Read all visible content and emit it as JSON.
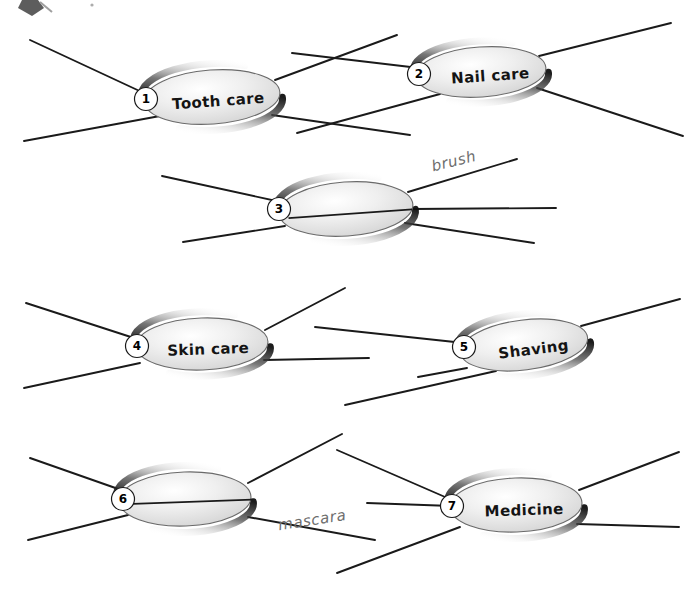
{
  "page": {
    "width": 687,
    "height": 591,
    "background": "#ffffff",
    "corner_mark": "partial-arrow-mark"
  },
  "colors": {
    "line": "#1a1a1a",
    "ellipse_fill_light": "#f3f3f3",
    "ellipse_fill_mid": "#d8d8d8",
    "ellipse_shadow": "#1c1c1c",
    "ellipse_stroke": "#6a6a6a",
    "text": "#141414",
    "handwriting": "#6d6d6d",
    "number_circle_fill": "#ffffff",
    "number_circle_stroke": "#1a1a1a"
  },
  "nodes": [
    {
      "number": "1",
      "label": "Tooth care",
      "blank": false,
      "cx": 212,
      "cy": 97,
      "rx": 68,
      "ry": 27,
      "rot": -4,
      "num_cx": 146,
      "num_cy": 99,
      "label_x": 218,
      "label_y": 102,
      "spokes": [
        {
          "x1": 146,
          "y1": 94,
          "x2": 30,
          "y2": 40
        },
        {
          "x1": 275,
          "y1": 80,
          "x2": 397,
          "y2": 35
        },
        {
          "x1": 160,
          "y1": 116,
          "x2": 24,
          "y2": 141
        },
        {
          "x1": 272,
          "y1": 115,
          "x2": 410,
          "y2": 135
        }
      ]
    },
    {
      "number": "2",
      "label": "Nail care",
      "blank": false,
      "cx": 481,
      "cy": 72,
      "rx": 65,
      "ry": 25,
      "rot": -4,
      "num_cx": 419,
      "num_cy": 74,
      "label_x": 490,
      "label_y": 77,
      "spokes": [
        {
          "x1": 419,
          "y1": 68,
          "x2": 292,
          "y2": 53
        },
        {
          "x1": 539,
          "y1": 56,
          "x2": 671,
          "y2": 23
        },
        {
          "x1": 440,
          "y1": 94,
          "x2": 297,
          "y2": 133
        },
        {
          "x1": 537,
          "y1": 88,
          "x2": 683,
          "y2": 136
        }
      ]
    },
    {
      "number": "3",
      "label": "",
      "blank": true,
      "cx": 346,
      "cy": 209,
      "rx": 67,
      "ry": 27,
      "rot": -4,
      "num_cx": 279,
      "num_cy": 209,
      "label_x": 346,
      "label_y": 214,
      "writing_line": {
        "x1": 288,
        "y1": 214,
        "x2": 412,
        "y2": 214
      },
      "spokes": [
        {
          "x1": 281,
          "y1": 202,
          "x2": 162,
          "y2": 176
        },
        {
          "x1": 408,
          "y1": 192,
          "x2": 517,
          "y2": 159
        },
        {
          "x1": 285,
          "y1": 226,
          "x2": 183,
          "y2": 242
        },
        {
          "x1": 405,
          "y1": 223,
          "x2": 534,
          "y2": 243
        },
        {
          "x1": 412,
          "y1": 209,
          "x2": 556,
          "y2": 208
        }
      ]
    },
    {
      "number": "4",
      "label": "Skin care",
      "blank": false,
      "cx": 202,
      "cy": 344,
      "rx": 66,
      "ry": 26,
      "rot": -2,
      "num_cx": 137,
      "num_cy": 346,
      "label_x": 208,
      "label_y": 350,
      "spokes": [
        {
          "x1": 137,
          "y1": 339,
          "x2": 26,
          "y2": 303
        },
        {
          "x1": 265,
          "y1": 330,
          "x2": 345,
          "y2": 288
        },
        {
          "x1": 140,
          "y1": 363,
          "x2": 24,
          "y2": 388
        },
        {
          "x1": 264,
          "y1": 360,
          "x2": 369,
          "y2": 358
        }
      ]
    },
    {
      "number": "5",
      "label": "Shaving",
      "blank": false,
      "cx": 524,
      "cy": 345,
      "rx": 64,
      "ry": 25,
      "rot": -7,
      "num_cx": 464,
      "num_cy": 347,
      "label_x": 533,
      "label_y": 351,
      "spokes": [
        {
          "x1": 464,
          "y1": 343,
          "x2": 315,
          "y2": 327
        },
        {
          "x1": 581,
          "y1": 326,
          "x2": 680,
          "y2": 299
        },
        {
          "x1": 467,
          "y1": 368,
          "x2": 418,
          "y2": 377
        },
        {
          "x1": 496,
          "y1": 371,
          "x2": 345,
          "y2": 405
        }
      ]
    },
    {
      "number": "6",
      "label": "",
      "blank": true,
      "cx": 185,
      "cy": 499,
      "rx": 66,
      "ry": 27,
      "rot": -2,
      "num_cx": 123,
      "num_cy": 499,
      "label_x": 185,
      "label_y": 504,
      "writing_line": {
        "x1": 133,
        "y1": 502,
        "x2": 252,
        "y2": 502
      },
      "spokes": [
        {
          "x1": 124,
          "y1": 491,
          "x2": 30,
          "y2": 458
        },
        {
          "x1": 248,
          "y1": 483,
          "x2": 342,
          "y2": 434
        },
        {
          "x1": 128,
          "y1": 515,
          "x2": 28,
          "y2": 540
        },
        {
          "x1": 248,
          "y1": 517,
          "x2": 375,
          "y2": 540
        }
      ]
    },
    {
      "number": "7",
      "label": "Medicine",
      "blank": false,
      "cx": 516,
      "cy": 505,
      "rx": 66,
      "ry": 27,
      "rot": -2,
      "num_cx": 452,
      "num_cy": 506,
      "label_x": 524,
      "label_y": 511,
      "spokes": [
        {
          "x1": 452,
          "y1": 500,
          "x2": 337,
          "y2": 450
        },
        {
          "x1": 579,
          "y1": 490,
          "x2": 679,
          "y2": 452
        },
        {
          "x1": 452,
          "y1": 506,
          "x2": 367,
          "y2": 503
        },
        {
          "x1": 460,
          "y1": 527,
          "x2": 337,
          "y2": 573
        },
        {
          "x1": 577,
          "y1": 524,
          "x2": 679,
          "y2": 527
        }
      ]
    }
  ],
  "handwritten_answers": [
    {
      "text": "brush",
      "x": 455,
      "y": 166,
      "rot": -14,
      "for_node": "3"
    },
    {
      "text": "mascara",
      "x": 313,
      "y": 525,
      "rot": -9,
      "for_node": "6"
    }
  ]
}
